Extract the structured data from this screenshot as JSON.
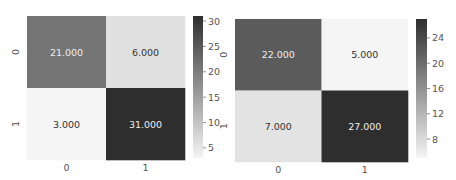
{
  "chart_data": [
    {
      "type": "heatmap",
      "title": "",
      "xlabel": "",
      "ylabel": "",
      "x_categories": [
        "0",
        "1"
      ],
      "y_categories": [
        "0",
        "1"
      ],
      "values": [
        [
          21,
          6
        ],
        [
          3,
          31
        ]
      ],
      "cell_labels": [
        [
          "21.000",
          "6.000"
        ],
        [
          "3.000",
          "31.000"
        ]
      ],
      "colormap": "Greys",
      "color_low": "#f5f5f5",
      "color_high": "#2e2e2e",
      "vmin": 3,
      "vmax": 31,
      "colorbar_ticks": [
        5,
        10,
        15,
        20,
        25,
        30
      ],
      "colorbar_tick_labels": [
        "5",
        "10",
        "15",
        "20",
        "25",
        "30"
      ],
      "colorbar_position": "right"
    },
    {
      "type": "heatmap",
      "title": "",
      "xlabel": "",
      "ylabel": "",
      "x_categories": [
        "0",
        "1"
      ],
      "y_categories": [
        "0",
        "1"
      ],
      "values": [
        [
          22,
          5
        ],
        [
          7,
          27
        ]
      ],
      "cell_labels": [
        [
          "22.000",
          "5.000"
        ],
        [
          "7.000",
          "27.000"
        ]
      ],
      "colormap": "Greys",
      "color_low": "#f5f5f5",
      "color_high": "#2e2e2e",
      "vmin": 5,
      "vmax": 27,
      "colorbar_ticks": [
        8,
        12,
        16,
        20,
        24
      ],
      "colorbar_tick_labels": [
        "8",
        "12",
        "16",
        "20",
        "24"
      ],
      "colorbar_position": "right"
    }
  ]
}
